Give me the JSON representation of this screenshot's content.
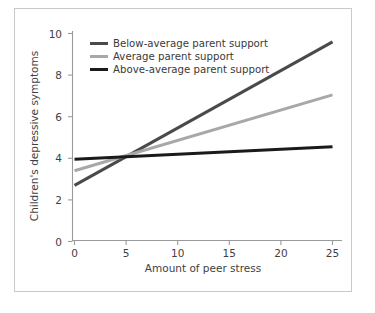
{
  "chart_data": {
    "type": "line",
    "title": "",
    "subtitle": "",
    "xlabel": "Amount of peer stress",
    "ylabel": "Children's depressive symptoms",
    "xlim": [
      0,
      25
    ],
    "ylim": [
      0,
      10
    ],
    "xticks": [
      "0",
      "5",
      "10",
      "15",
      "20",
      "25"
    ],
    "xtick_values": [
      0,
      5,
      10,
      15,
      20,
      25
    ],
    "yticks": [
      "0",
      "2",
      "4",
      "6",
      "8",
      "10"
    ],
    "ytick_values": [
      0,
      2,
      4,
      6,
      8,
      10
    ],
    "grid": false,
    "legend_position": "upper-left-inside",
    "x": [
      0,
      25
    ],
    "series": [
      {
        "name": "Below-average parent support",
        "values": [
          2.7,
          9.6
        ],
        "color": "#4a4a4a",
        "width": 3.0
      },
      {
        "name": "Average parent support",
        "values": [
          3.4,
          7.05
        ],
        "color": "#a8a8a8",
        "width": 3.0
      },
      {
        "name": "Above-average parent support",
        "values": [
          3.95,
          4.55
        ],
        "color": "#1a1a1a",
        "width": 3.0
      }
    ],
    "annotations": []
  },
  "legend": {
    "items": [
      {
        "label": "Below-average parent support"
      },
      {
        "label": "Average parent support"
      },
      {
        "label": "Above-average parent support"
      }
    ]
  },
  "axes": {
    "x_title": "Amount of peer stress",
    "y_title": "Children's depressive symptoms",
    "x_tick_labels": [
      "0",
      "5",
      "10",
      "15",
      "20",
      "25"
    ],
    "y_tick_labels": [
      "0",
      "2",
      "4",
      "6",
      "8",
      "10"
    ]
  },
  "colors": {
    "below_average": "#4a4a4a",
    "average": "#a8a8a8",
    "above_average": "#1a1a1a",
    "axis": "#9a9a9a",
    "frame": "#c9c9c9",
    "background": "#ffffff",
    "text": "#3a3a3a"
  }
}
